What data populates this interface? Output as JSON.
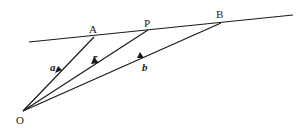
{
  "diagram": {
    "type": "vector-geometry",
    "colors": {
      "line": "#1a1a1a",
      "text": "#222222",
      "background": "#ffffff"
    },
    "points": {
      "O": {
        "label": "O",
        "x": 23,
        "y": 111
      },
      "A": {
        "label": "A",
        "x": 94,
        "y": 37
      },
      "P": {
        "label": "P",
        "x": 148,
        "y": 30
      },
      "B": {
        "label": "B",
        "x": 221,
        "y": 23
      }
    },
    "line": {
      "x1": 29,
      "y1": 42,
      "x2": 293,
      "y2": 15
    },
    "vectors": [
      {
        "label": "a",
        "from": "O",
        "to": "A"
      },
      {
        "label": "r",
        "from": "O",
        "to": "P"
      },
      {
        "label": "b",
        "from": "O",
        "to": "B"
      }
    ]
  }
}
